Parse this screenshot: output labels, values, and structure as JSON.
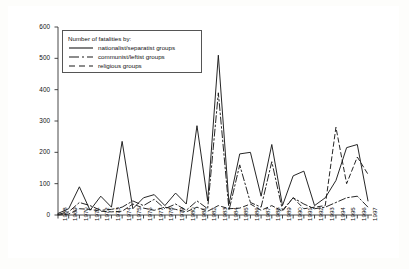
{
  "figure": {
    "background_color": "#ffffff",
    "frame_color": "#3a3a3a"
  },
  "legend": {
    "title": "Number of fatalities by:",
    "entries": [
      {
        "label": "nationalist/separatist groups",
        "style": "solid",
        "color": "#1a1a1a"
      },
      {
        "label": "communist/leftist groups",
        "style": "dash-dot",
        "color": "#1a1a1a"
      },
      {
        "label": "religious groups",
        "style": "dashed",
        "color": "#1a1a1a"
      }
    ]
  },
  "chart_data": {
    "type": "line",
    "title": "",
    "xlabel": "",
    "ylabel": "",
    "xlim": [
      1968,
      1997
    ],
    "ylim": [
      0,
      600
    ],
    "yticks": [
      0,
      100,
      200,
      300,
      400,
      500,
      600
    ],
    "ytick_labels": [
      "0",
      "100",
      "200",
      "300",
      "400",
      "500",
      "600"
    ],
    "grid": false,
    "legend_position": "upper-left",
    "categories": [
      "1968",
      "1969",
      "1970",
      "1971",
      "1972",
      "1973",
      "1974",
      "1975",
      "1976",
      "1977",
      "1978",
      "1979",
      "1980",
      "1981",
      "1982",
      "1983",
      "1984",
      "1985",
      "1986",
      "1987",
      "1988",
      "1989",
      "1990",
      "1991",
      "1992",
      "1993",
      "1994",
      "1995",
      "1996",
      "1997"
    ],
    "x": [
      1968,
      1969,
      1970,
      1971,
      1972,
      1973,
      1974,
      1975,
      1976,
      1977,
      1978,
      1979,
      1980,
      1981,
      1982,
      1983,
      1984,
      1985,
      1986,
      1987,
      1988,
      1989,
      1990,
      1991,
      1992,
      1993,
      1994,
      1995,
      1996,
      1997
    ],
    "series": [
      {
        "name": "nationalist/separatist groups",
        "style": "solid",
        "color": "#1a1a1a",
        "values": [
          5,
          20,
          90,
          15,
          60,
          25,
          235,
          20,
          55,
          65,
          30,
          70,
          35,
          285,
          45,
          510,
          35,
          195,
          200,
          60,
          225,
          30,
          125,
          140,
          30,
          55,
          110,
          215,
          225,
          45
        ]
      },
      {
        "name": "communist/leftist groups",
        "style": "dash-dot",
        "color": "#1a1a1a",
        "values": [
          2,
          10,
          40,
          30,
          15,
          18,
          25,
          45,
          30,
          50,
          20,
          35,
          15,
          45,
          20,
          390,
          15,
          160,
          40,
          25,
          170,
          15,
          55,
          35,
          20,
          25,
          40,
          55,
          60,
          25
        ]
      },
      {
        "name": "religious groups",
        "style": "dashed",
        "color": "#1a1a1a",
        "values": [
          0,
          3,
          20,
          18,
          12,
          10,
          12,
          35,
          22,
          15,
          25,
          18,
          10,
          25,
          12,
          30,
          20,
          22,
          35,
          15,
          30,
          12,
          55,
          20,
          25,
          30,
          280,
          100,
          185,
          130
        ]
      }
    ]
  }
}
